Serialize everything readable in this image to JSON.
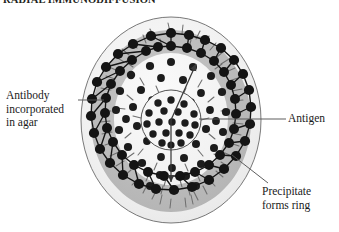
{
  "figure": {
    "title": "RADIAL IMMUNODIFFUSION",
    "type": "biology-assay-diagram"
  },
  "labels": {
    "antibody": "Antibody\nincorporated\nin agar",
    "antigen": "Antigen",
    "precipitate": "Precipitate\nforms ring"
  },
  "icons": {
    "antibody_marker": "y-shaped-antibody-icon",
    "antigen_marker": "filled-dot-icon",
    "diffusion_arrow": "arrow-icon"
  },
  "colors": {
    "dish_outline": "#5a5a5a",
    "agar_fill": "#f0f0f0",
    "precipitate_band": "#b9b9b9",
    "antigen_dot": "#1a1a1a",
    "well_outline": "#4a4a4a",
    "leader_line": "#555555",
    "antibody_stroke": "#6b6b6b",
    "background": "#ffffff"
  },
  "geometry": {
    "dish_center_x": 171,
    "dish_center_y": 120,
    "dish_radius_x": 91,
    "dish_radius_y": 104,
    "band_outer_radius_x": 80,
    "band_outer_radius_y": 91,
    "band_inner_radius_x": 57,
    "band_inner_radius_y": 65,
    "well_radius_x": 30,
    "well_radius_y": 30
  },
  "leaders": {
    "antibody_line": "horizontal leader from Antibody label to dish left edge",
    "antigen_line": "horizontal leader from Antigen label to central well",
    "precipitate_line": "diagonal leader from Precipitate label to ring band"
  }
}
